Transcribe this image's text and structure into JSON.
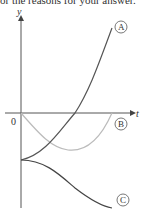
{
  "header": {
    "cut_text": "or the reasons for your answer."
  },
  "diagram": {
    "y_axis_label": "y",
    "x_axis_label": "t",
    "origin_label": "0",
    "curves": [
      {
        "id": "A",
        "label": "A",
        "description": "starts below origin on y-axis, increases steeply",
        "color": "#555555"
      },
      {
        "id": "B",
        "label": "B",
        "description": "starts at origin, dips to a minimum, returns to t-axis",
        "color": "#bbbbbb"
      },
      {
        "id": "C",
        "label": "C",
        "description": "starts at same point as A, decreases",
        "color": "#444444"
      }
    ]
  }
}
